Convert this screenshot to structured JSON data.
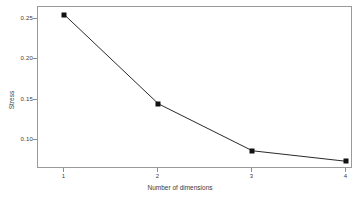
{
  "chart_data": {
    "type": "line",
    "title": "",
    "subtitle": "",
    "xlabel": "Number of dimensions",
    "ylabel": "Stress",
    "x": [
      1,
      2,
      3,
      4
    ],
    "values": [
      0.255,
      0.145,
      0.087,
      0.074
    ],
    "series": [
      {
        "name": "Stress",
        "values": [
          0.255,
          0.145,
          0.087,
          0.074
        ]
      }
    ],
    "x_tick_labels": [
      "1",
      "2",
      "3",
      "4"
    ],
    "y_tick_labels": [
      "0.25",
      "0.20",
      "0.15",
      "0.10"
    ],
    "y_ticks": [
      0.25,
      0.2,
      0.15,
      0.1
    ],
    "xlim": [
      0.72,
      4.07
    ],
    "ylim": [
      0.0645,
      0.2645
    ],
    "grid": false,
    "legend": false,
    "legend_position": "none",
    "marker": "filled-square",
    "line_color": "#111111",
    "marker_color": "#111111",
    "frame_color": "#9a9a9a",
    "background": "#ffffff"
  }
}
